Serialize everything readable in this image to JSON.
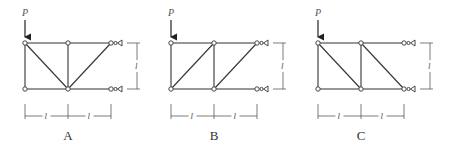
{
  "figure": {
    "load_label": "P",
    "span_label": "l",
    "height_label": "l",
    "panels": [
      {
        "caption": "A",
        "x0": 25,
        "diagonals": [
          [
            0,
            0,
            1,
            1
          ],
          [
            1,
            1,
            2,
            0
          ]
        ]
      },
      {
        "caption": "B",
        "x0": 171,
        "diagonals": [
          [
            0,
            1,
            1,
            0
          ],
          [
            1,
            1,
            2,
            0
          ]
        ]
      },
      {
        "caption": "C",
        "x0": 318,
        "diagonals": [
          [
            0,
            0,
            1,
            1
          ],
          [
            1,
            0,
            2,
            1
          ]
        ]
      }
    ]
  }
}
